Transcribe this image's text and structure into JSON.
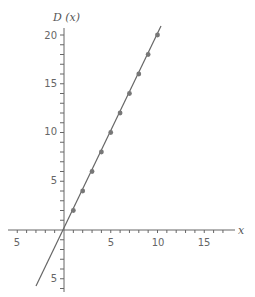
{
  "chart_data": {
    "type": "scatter",
    "title": "",
    "xlabel": "x",
    "ylabel": "D (x)",
    "xlim": [
      -6,
      18
    ],
    "ylim": [
      -6,
      21
    ],
    "grid": false,
    "x_ticks_labeled": [
      {
        "value": -5,
        "label": "5"
      },
      {
        "value": 5,
        "label": "5"
      },
      {
        "value": 10,
        "label": "10"
      },
      {
        "value": 15,
        "label": "15"
      }
    ],
    "y_ticks_labeled": [
      {
        "value": 20,
        "label": "20"
      },
      {
        "value": 15,
        "label": "15"
      },
      {
        "value": 10,
        "label": "10"
      },
      {
        "value": 5,
        "label": "5"
      },
      {
        "value": -5,
        "label": "5"
      }
    ],
    "series": [
      {
        "name": "points",
        "kind": "scatter",
        "x": [
          1,
          2,
          3,
          4,
          5,
          6,
          7,
          8,
          9,
          10
        ],
        "y": [
          2,
          4,
          6,
          8,
          10,
          12,
          14,
          16,
          18,
          20
        ]
      },
      {
        "name": "D(x) = 2x",
        "kind": "line",
        "x": [
          -2.9,
          10.2
        ],
        "y": [
          -5.8,
          20.4
        ]
      }
    ],
    "colors": {
      "axis": "#666666",
      "line": "#666666",
      "points": "#777777"
    }
  },
  "labels": {
    "y_axis_title": "D (x)",
    "x_axis_title": "x",
    "x_tick_neg5": "5",
    "x_tick_5": "5",
    "x_tick_10": "10",
    "x_tick_15": "15",
    "y_tick_20": "20",
    "y_tick_15": "15",
    "y_tick_10": "10",
    "y_tick_5": "5",
    "y_tick_neg5": "5"
  }
}
